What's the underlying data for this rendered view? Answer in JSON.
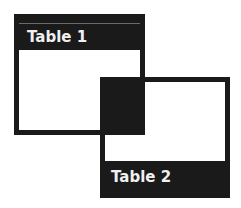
{
  "tables": [
    {
      "label": "Table 1",
      "header_position": "top"
    },
    {
      "label": "Table 2",
      "header_position": "bottom"
    }
  ],
  "colors": {
    "fill": "#1a1a1a",
    "background": "#ffffff",
    "text": "#f0f0f0"
  }
}
